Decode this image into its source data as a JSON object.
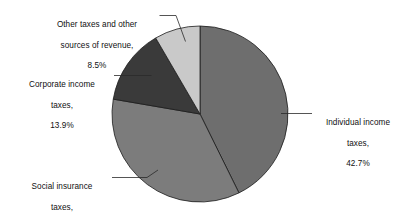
{
  "chart_data": {
    "type": "pie",
    "title": "",
    "subtitle": "",
    "xlabel": "",
    "ylabel": "",
    "legend_position": "none",
    "grid": false,
    "units": "percent",
    "start_angle_deg": 0,
    "direction": "clockwise",
    "center": {
      "x": 200,
      "y": 114
    },
    "radius": 88,
    "categories": [
      "Individual income taxes",
      "Social insurance taxes",
      "Corporate income taxes",
      "Other taxes and other sources of revenue"
    ],
    "values": [
      42.7,
      35.0,
      13.9,
      8.5
    ],
    "value_labels": [
      "42.7%",
      "35.0%",
      "13.9%",
      "8.5%"
    ],
    "colors": [
      "#6e6e6e",
      "#7c7c7c",
      "#3a3a3a",
      "#c9c9c9"
    ],
    "slices": [
      {
        "name": "Individual income taxes",
        "label_line1": "Individual income",
        "label_line2": "taxes,",
        "label_line3": "42.7%",
        "value": 42.7,
        "value_label": "42.7%",
        "color": "#6e6e6e",
        "start_deg": 0.0,
        "end_deg": 153.72
      },
      {
        "name": "Social insurance taxes",
        "label_line1": "Social insurance",
        "label_line2": "taxes,",
        "label_line3": "35.0%",
        "value": 35.0,
        "value_label": "35.0%",
        "color": "#7c7c7c",
        "start_deg": 153.72,
        "end_deg": 279.72
      },
      {
        "name": "Corporate income taxes",
        "label_line1": "Corporate income",
        "label_line2": "taxes,",
        "label_line3": "13.9%",
        "value": 13.9,
        "value_label": "13.9%",
        "color": "#3a3a3a",
        "start_deg": 279.72,
        "end_deg": 329.76
      },
      {
        "name": "Other taxes and other sources of revenue",
        "label_line1": "Other taxes and other",
        "label_line2": "sources of revenue,",
        "label_line3": "8.5%",
        "value": 8.5,
        "value_label": "8.5%",
        "color": "#c9c9c9",
        "start_deg": 329.76,
        "end_deg": 360.0
      }
    ]
  },
  "labels": {
    "other": {
      "line1": "Other taxes and other",
      "line2": "sources of revenue,",
      "line3": "8.5%"
    },
    "corporate": {
      "line1": "Corporate income",
      "line2": "taxes,",
      "line3": "13.9%"
    },
    "social": {
      "line1": "Social insurance",
      "line2": "taxes,",
      "line3": "35.0%"
    },
    "individual": {
      "line1": "Individual income",
      "line2": "taxes,",
      "line3": "42.7%"
    }
  }
}
